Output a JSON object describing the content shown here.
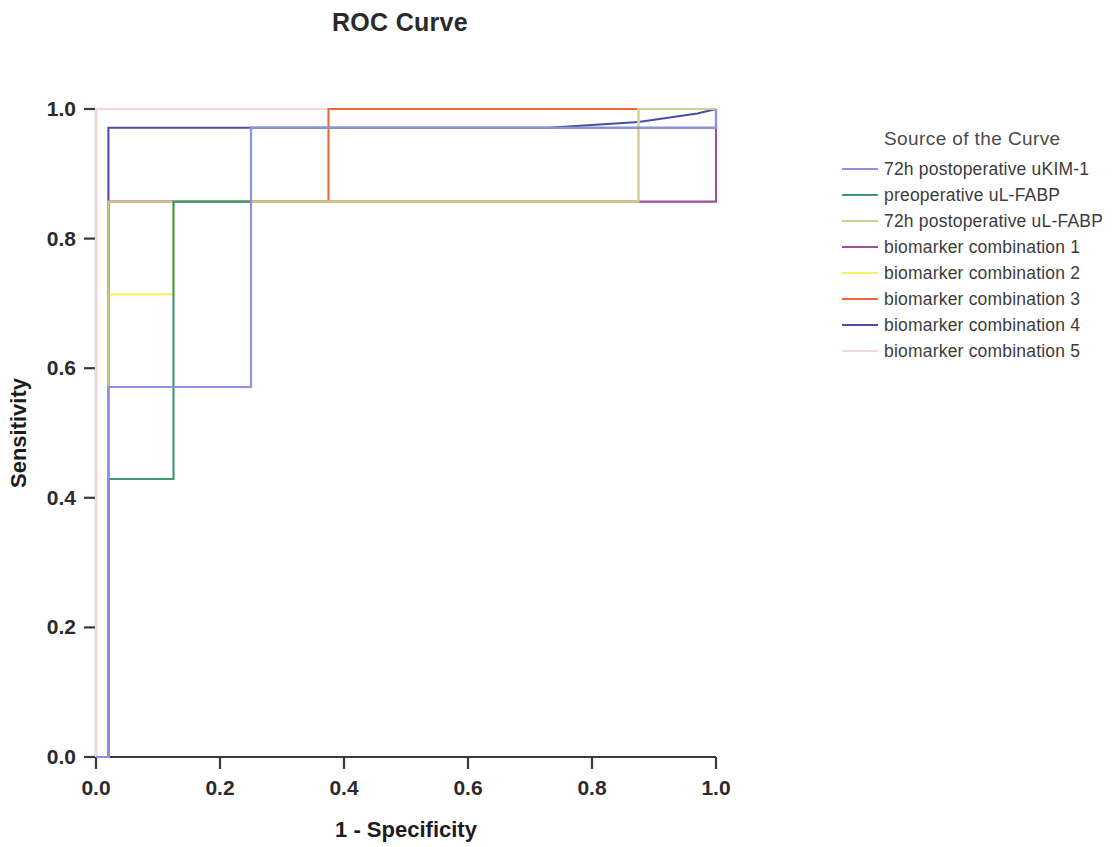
{
  "chart_data": {
    "type": "line",
    "title": "ROC Curve",
    "xlabel": "1 - Specificity",
    "ylabel": "Sensitivity",
    "xlim": [
      0,
      1
    ],
    "ylim": [
      0,
      1
    ],
    "grid": false,
    "legend_position": "right",
    "legend_title": "Source of the Curve",
    "xticks": [
      "0.0",
      "0.2",
      "0.4",
      "0.6",
      "0.8",
      "1.0"
    ],
    "xtick_values": [
      0.0,
      0.2,
      0.4,
      0.6,
      0.8,
      1.0
    ],
    "yticks": [
      "0.0",
      "0.2",
      "0.4",
      "0.6",
      "0.8",
      "1.0"
    ],
    "ytick_values": [
      0.0,
      0.2,
      0.4,
      0.6,
      0.8,
      1.0
    ],
    "series": [
      {
        "name": "72h postoperative uKIM-1",
        "color": "#8f8fe0",
        "x": [
          0.0,
          0.0,
          0.02,
          0.02,
          0.25,
          0.25,
          1.0,
          1.0
        ],
        "y": [
          0.0,
          0.0,
          0.0,
          0.571,
          0.571,
          0.971,
          0.971,
          1.0
        ]
      },
      {
        "name": "preoperative uL-FABP",
        "color": "#3d9970",
        "x": [
          0.0,
          0.0,
          0.02,
          0.02,
          0.125,
          0.125,
          0.25,
          0.25,
          1.0,
          1.0
        ],
        "y": [
          0.0,
          0.0,
          0.0,
          0.429,
          0.429,
          0.857,
          0.857,
          0.971,
          0.971,
          1.0
        ]
      },
      {
        "name": "72h postoperative uL-FABP",
        "color": "#cfcf8a",
        "x": [
          0.0,
          0.0,
          0.02,
          0.02,
          0.875,
          0.875,
          1.0,
          1.0
        ],
        "y": [
          0.0,
          0.0,
          0.0,
          0.857,
          0.857,
          1.0,
          1.0,
          1.0
        ]
      },
      {
        "name": "biomarker combination 1",
        "color": "#9a4f9e",
        "x": [
          0.0,
          0.0,
          0.02,
          0.02,
          1.0,
          1.0
        ],
        "y": [
          0.0,
          0.0,
          0.0,
          0.857,
          0.857,
          1.0
        ]
      },
      {
        "name": "biomarker combination 2",
        "color": "#f5f06a",
        "x": [
          0.0,
          0.0,
          0.02,
          0.02,
          0.125,
          0.125,
          0.875,
          0.875,
          1.0,
          1.0
        ],
        "y": [
          0.0,
          0.0,
          0.0,
          0.714,
          0.714,
          0.857,
          0.857,
          1.0,
          1.0,
          1.0
        ]
      },
      {
        "name": "biomarker combination 3",
        "color": "#f4643c",
        "x": [
          0.0,
          0.0,
          0.02,
          0.02,
          0.375,
          0.375,
          1.0,
          1.0
        ],
        "y": [
          0.0,
          0.0,
          0.0,
          0.857,
          0.857,
          1.0,
          1.0,
          1.0
        ]
      },
      {
        "name": "biomarker combination 4",
        "color": "#4c4ca8",
        "x": [
          0.0,
          0.0,
          0.02,
          0.02,
          0.73,
          0.875,
          0.97,
          1.0
        ],
        "y": [
          0.0,
          0.0,
          0.0,
          0.971,
          0.971,
          0.98,
          0.993,
          1.0
        ]
      },
      {
        "name": "biomarker combination 5",
        "color": "#f0d9d9",
        "x": [
          0.0,
          0.0,
          0.0,
          1.0,
          1.0
        ],
        "y": [
          0.0,
          0.0,
          1.0,
          1.0,
          1.0
        ]
      }
    ]
  },
  "legend": {
    "title": "Source of the Curve",
    "items": [
      {
        "label": "72h postoperative uKIM-1",
        "color": "#8f8fe0"
      },
      {
        "label": "preoperative uL-FABP",
        "color": "#3d9970"
      },
      {
        "label": "72h postoperative uL-FABP",
        "color": "#cfcf8a"
      },
      {
        "label": "biomarker combination 1",
        "color": "#9a4f9e"
      },
      {
        "label": "biomarker combination 2",
        "color": "#f5f06a"
      },
      {
        "label": "biomarker combination 3",
        "color": "#f4643c"
      },
      {
        "label": "biomarker combination 4",
        "color": "#4c4ca8"
      },
      {
        "label": "biomarker combination 5",
        "color": "#f0d9d9"
      }
    ]
  }
}
